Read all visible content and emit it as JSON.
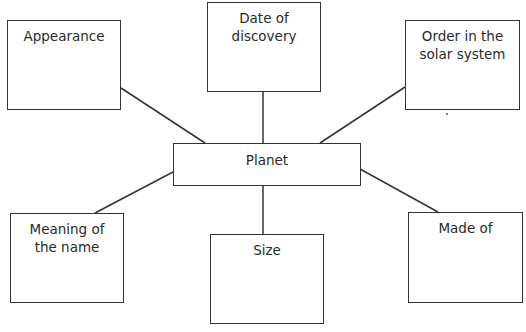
{
  "diagram": {
    "type": "mind-map",
    "center": {
      "label": "Planet"
    },
    "nodes": [
      {
        "id": "appearance",
        "lines": [
          "Appearance"
        ]
      },
      {
        "id": "date",
        "lines": [
          "Date of",
          "discovery"
        ]
      },
      {
        "id": "order",
        "lines": [
          "Order in the",
          "solar system"
        ]
      },
      {
        "id": "meaning",
        "lines": [
          "Meaning of",
          "the name"
        ]
      },
      {
        "id": "size",
        "lines": [
          "Size"
        ]
      },
      {
        "id": "made",
        "lines": [
          "Made of"
        ]
      }
    ],
    "colors": {
      "line": "#333333",
      "text": "#2a2a2a",
      "background": "#ffffff"
    }
  }
}
